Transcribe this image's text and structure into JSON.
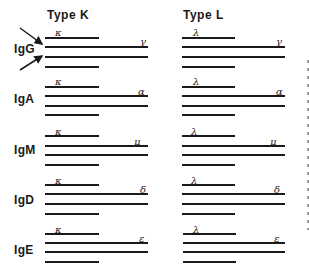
{
  "columns": [
    {
      "title": "Type K",
      "light_chain": "κ"
    },
    {
      "title": "Type L",
      "light_chain": "λ"
    }
  ],
  "classes": [
    {
      "label": "IgG",
      "heavy_chain": "γ"
    },
    {
      "label": "IgA",
      "heavy_chain": "α"
    },
    {
      "label": "IgM",
      "heavy_chain": "μ"
    },
    {
      "label": "IgD",
      "heavy_chain": "δ"
    },
    {
      "label": "IgE",
      "heavy_chain": "ε"
    }
  ],
  "colors": {
    "ink": "#1a1a1a",
    "background": "#ffffff"
  }
}
